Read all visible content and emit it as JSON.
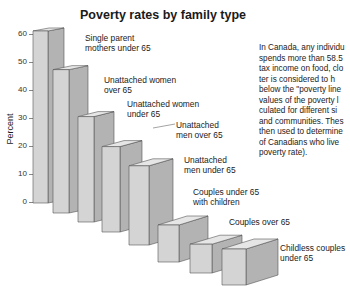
{
  "chart_data": {
    "type": "bar",
    "title": "Poverty rates by family type",
    "xlabel": "",
    "ylabel": "Percent",
    "ylim": [
      0,
      60
    ],
    "yticks": [
      0,
      10,
      20,
      30,
      40,
      50,
      60
    ],
    "grid": false,
    "style": "3d-perspective-bars",
    "categories": [
      "Single parent mothers under 65",
      "Unattached women over 65",
      "Unattached women under 65",
      "Unattached men over 65",
      "Unattached men under 65",
      "Couples under 65 with children",
      "Couples over 65",
      "Childless couples under 65"
    ],
    "values": [
      61,
      47,
      34,
      28,
      22,
      10,
      8,
      8
    ],
    "annotation": "In Canada, any individual who spends more than 58.5% of pre-tax income on food, clothing and shelter is considered to be living below the \"poverty line\" (the values of the poverty line are calculated for different sizes of families and communities. These are then used to determine the proportion of Canadians who live in poverty — the poverty rate)."
  },
  "labels": {
    "title": "Poverty rates by family type",
    "ylabel": "Percent",
    "yticks": [
      "60",
      "50",
      "40",
      "30",
      "20",
      "10",
      "0"
    ],
    "bars": [
      "Single parent\nmothers under 65",
      "Unattached women\nover 65",
      "Unattached women\nunder 65",
      "Unattached\nmen over 65",
      "Unattached\nmen under 65",
      "Couples under 65\nwith children",
      "Couples over 65",
      "Childless couples\nunder 65"
    ],
    "note": "In Canada, any individu\nspends more than 58.5\ntax income on food, clo\nter is considered to h\nbelow the \"poverty line\nvalues of the poverty l\nculated for different si\nand communities. Thes\nthen used to determine\nof Canadians who live\npoverty rate)."
  },
  "colors": {
    "front": "#d4d4d4",
    "side": "#b3b3b3",
    "top": "#e6e6e6",
    "edge": "#555555"
  }
}
